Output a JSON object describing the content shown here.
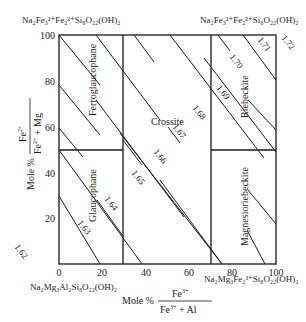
{
  "diagram": {
    "type": "amphibole composition diagram",
    "y_axis": {
      "label_prefix": "Mole %",
      "numerator": "Fe",
      "numerator_sup": "2+",
      "denominator_a": "Fe",
      "denominator_a_sup": "2+",
      "denominator_b": " + Mg",
      "ticks": [
        "20",
        "40",
        "60",
        "80",
        "100"
      ]
    },
    "x_axis": {
      "label_prefix": "Mole %",
      "numerator": "Fe",
      "numerator_sup": "3+",
      "denominator_a": "Fe",
      "denominator_a_sup": "3+",
      "denominator_b": " + Al",
      "ticks": [
        "0",
        "20",
        "40",
        "60",
        "80",
        "100"
      ]
    },
    "corners": {
      "top_left": "Na₂Fe₃²⁺Fe₂³⁺Si₈O₂₂(OH)₂",
      "top_right": "Na₂Fe₃²⁺Fe₂³⁺Si₈O₂₂(OH)₂",
      "bottom_left": "Na₂Mg₃Al₂Si₈O₂₂(OH)₂",
      "bottom_right": "Na₂Mg₃Fe₂³⁺Si₈O₂₂(OH)₂"
    },
    "fields": {
      "ferroglaucophane": "Ferroglaucophane",
      "glaucophane": "Glaucophane",
      "crossite": "Crossite",
      "riebeckite": "Riebeckite",
      "magnesioriebeckite": "Magnesioriebeckite"
    },
    "isolines": [
      "1.62",
      "1.63",
      "1.64",
      "1.65",
      "1.66",
      "1.67",
      "1.68",
      "1.69",
      "1.70",
      "1.71",
      "1.72"
    ]
  }
}
